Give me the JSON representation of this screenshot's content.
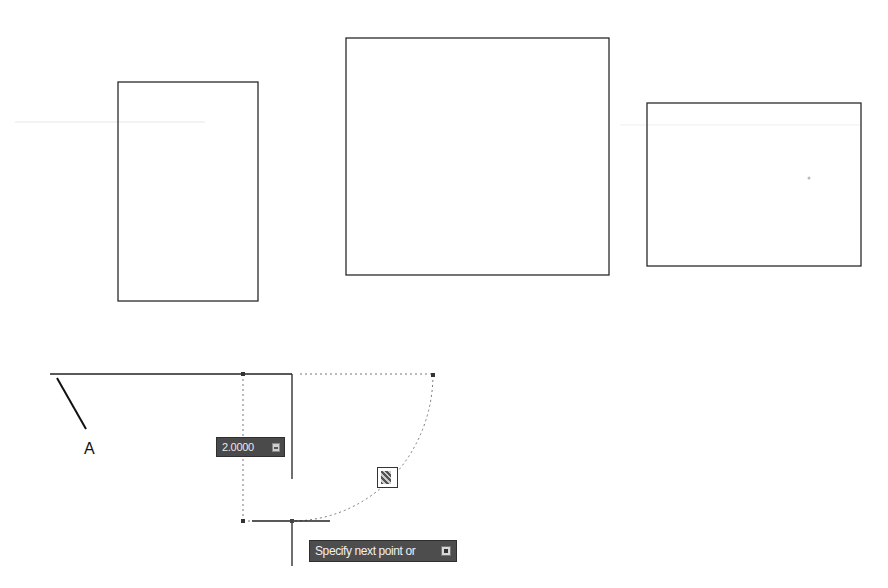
{
  "drawing": {
    "rectangles": [
      {
        "name": "rectangle-1",
        "x": 118,
        "y": 82,
        "width": 140,
        "height": 219
      },
      {
        "name": "rectangle-2",
        "x": 346,
        "y": 38,
        "width": 263,
        "height": 237
      },
      {
        "name": "rectangle-3",
        "x": 647,
        "y": 103,
        "width": 214,
        "height": 163
      }
    ],
    "point_label": "A",
    "stroke_color": "#222222",
    "tracking_color": "#777777"
  },
  "dynamic_input": {
    "value": "2.0000"
  },
  "command_tooltip": {
    "prompt": "Specify next point or"
  }
}
